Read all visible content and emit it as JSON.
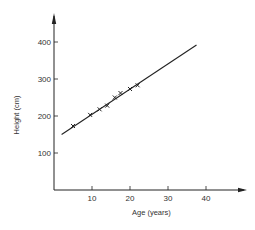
{
  "chart_data": {
    "type": "scatter",
    "title": "",
    "xlabel": "Age (years)",
    "ylabel": "Height (cm)",
    "xlim": [
      0,
      50
    ],
    "ylim": [
      0,
      480
    ],
    "xticks": [
      10,
      20,
      30,
      40
    ],
    "yticks": [
      100,
      200,
      300,
      400
    ],
    "xtick_labels": [
      "10",
      "20",
      "30",
      "40"
    ],
    "ytick_labels": [
      "100",
      "200",
      "300",
      "400"
    ],
    "grid": false,
    "legend": "none",
    "marker": "x",
    "series": [
      {
        "name": "observations",
        "x": [
          5,
          9.5,
          12,
          14,
          16,
          17.5,
          20,
          22
        ],
        "y": [
          173,
          203,
          218,
          228,
          250,
          262,
          273,
          283
        ]
      }
    ],
    "fit_line": {
      "x": [
        2,
        37.5
      ],
      "y": [
        150,
        392
      ]
    }
  }
}
